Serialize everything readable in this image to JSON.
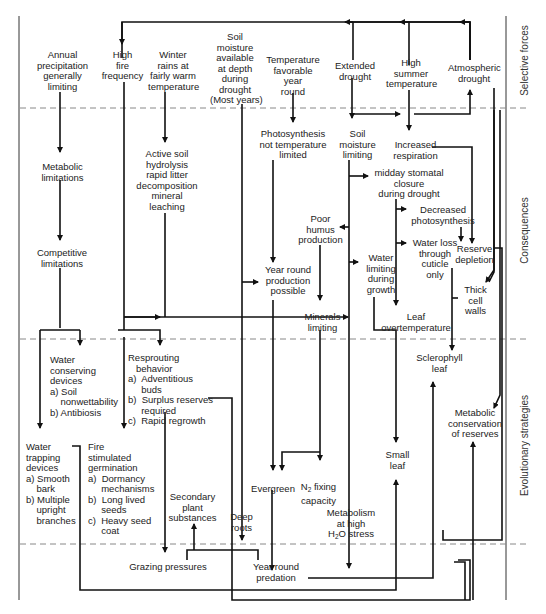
{
  "bands": [
    {
      "id": "selective",
      "label": "Selective forces"
    },
    {
      "id": "consequences",
      "label": "Consequences"
    },
    {
      "id": "strategies",
      "label": "Evolutionary strategies"
    }
  ],
  "nodes": {
    "annual_precip": "Annual\nprecipitation\ngenerally\nlimiting",
    "high_fire": "High\nfire\nfrequency",
    "winter_rains": "Winter\nrains at\nfairly warm\ntemperature",
    "soil_moisture_depth": "Soil\nmoisture\navailable\nat depth\nduring\ndrought\n(Most years)",
    "temp_favorable": "Temperature\nfavorable\nyear\nround",
    "extended_drought": "Extended\ndrought",
    "high_summer_temp": "High\nsummer\ntemperature",
    "atmospheric_drought": "Atmospheric\ndrought",
    "metabolic_limitations": "Metabolic\nlimitations",
    "active_soil": "Active soil\nhydrolysis\nrapid litter\ndecomposition\nmineral\nleaching",
    "photosynthesis_not_limited": "Photosynthesis\nnot temperature\nlimited",
    "soil_moisture_limiting": "Soil\nmoisture\nlimiting",
    "increased_respiration": "Increased\nrespiration",
    "midday_closure": "midday stomatal\nclosure\nduring drought",
    "decreased_photosynthesis": "Decreased\nphotosynthesis",
    "poor_humus": "Poor\nhumus\nproduction",
    "water_loss_cuticle": "Water loss\nthrough\ncuticle\nonly",
    "reserve_depletion": "Reserve\ndepletion",
    "competitive_limitations": "Competitive\nlimitations",
    "year_round_production": "Year round\nproduction\npossible",
    "water_limiting_growth": "Water\nlimiting\nduring\ngrowth",
    "thick_cell_walls": "Thick\ncell\nwalls",
    "minerals_limiting": "Minerals\nlimiting",
    "leaf_overtemperature": "Leaf\novertemperature",
    "water_conserving": "Water\nconserving\ndevices\na) Soil\n    nonwettability\nb) Antibiosis",
    "resprouting": "Resprouting\n   behavior\na)  Adventitious\n     buds\nb)  Surplus reserves\n     required\nc)  Rapid regrowth",
    "sclerophyll_leaf": "Sclerophyll\nleaf",
    "metabolic_conservation": "Metabolic\nconservation\nof reserves",
    "water_trapping": "Water\ntrapping\ndevices\na) Smooth\n    bark\nb) Multiple\n    upright\n    branches",
    "fire_germination": "Fire\nstimulated\ngermination\na)  Dormancy\n     mechanisms\nb)  Long lived\n     seeds\nc)  Heavy seed\n     coat",
    "secondary_plant": "Secondary\nplant\nsubstances",
    "evergreen": "Evergreen",
    "n2_fixing_pre": "N",
    "n2_fixing_sub": "2",
    "n2_fixing_post": " fixing\ncapacity",
    "small_leaf": "Small\nleaf",
    "deep_roots": "Deep\nroots",
    "metabolism_high_pre": "Metabolism\nat high\nH",
    "metabolism_high_sub": "2",
    "metabolism_high_post": "O stress",
    "grazing_pressures": "Grazing pressures",
    "year_round_predation": "Year round\npredation"
  },
  "colors": {
    "line": "#111111",
    "dash": "#888888",
    "text": "#222222",
    "background": "#ffffff"
  }
}
